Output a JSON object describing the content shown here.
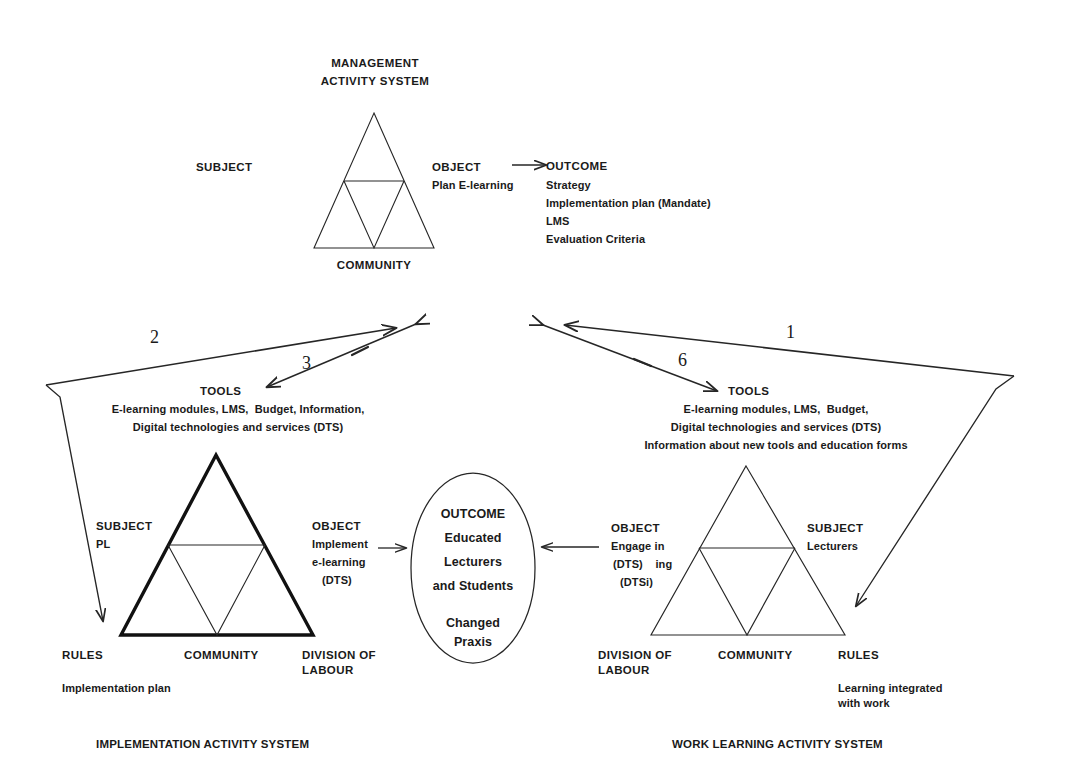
{
  "diagram": {
    "title_top": "MANAGEMENT\nACTIVITY SYSTEM",
    "caption_left": "IMPLEMENTATION ACTIVITY SYSTEM",
    "caption_right": "WORK LEARNING ACTIVITY SYSTEM",
    "stroke_color": "#262626",
    "bold_stroke_color": "#111111",
    "background": "#ffffff"
  },
  "management_system": {
    "name": "MANAGEMENT ACTIVITY SYSTEM",
    "title_line1": "MANAGEMENT",
    "title_line2": "ACTIVITY SYSTEM",
    "subject_label": "SUBJECT",
    "community_label": "COMMUNITY",
    "object_label": "OBJECT",
    "object_value": "Plan E-learning",
    "outcome_heading": "OUTCOME",
    "outcome_items": [
      "Strategy",
      "Implementation plan (Mandate)",
      "LMS",
      "Evaluation Criteria"
    ]
  },
  "implementation_system": {
    "caption": "IMPLEMENTATION ACTIVITY SYSTEM",
    "tools_label": "TOOLS",
    "tools_lines": [
      "E-learning modules, LMS,  Budget, Information,",
      "Digital technologies and services (DTS)"
    ],
    "subject_label": "SUBJECT",
    "subject_value": "PL",
    "object_label": "OBJECT",
    "object_lines": [
      "Implement",
      "e-learning",
      "(DTS)"
    ],
    "rules_label": "RULES",
    "rules_value": "Implementation plan",
    "community_label": "COMMUNITY",
    "division_label": "DIVISION OF\nLABOUR"
  },
  "work_learning_system": {
    "caption": "WORK LEARNING ACTIVITY SYSTEM",
    "tools_label": "TOOLS",
    "tools_lines": [
      "E-learning modules, LMS,  Budget,",
      "Digital technologies and services (DTS)",
      "Information about new tools and education forms"
    ],
    "subject_label": "SUBJECT",
    "subject_value": "Lecturers",
    "object_label": "OBJECT",
    "object_lines": [
      "Engage in",
      "(DTS)    ing",
      "(DTSi)"
    ],
    "rules_label": "RULES",
    "rules_value": "Learning integrated\nwith work",
    "community_label": "COMMUNITY",
    "division_label": "DIVISION OF\nLABOUR"
  },
  "outcome_oval": {
    "heading": "OUTCOME",
    "lines": [
      "Educated",
      "Lecturers",
      "and Students"
    ],
    "footer": "Changed\nPraxis"
  },
  "arrows": {
    "labels": [
      {
        "id": "1",
        "text": "1"
      },
      {
        "id": "2",
        "text": "2"
      },
      {
        "id": "3",
        "text": "3"
      },
      {
        "id": "6",
        "text": "6"
      }
    ]
  }
}
